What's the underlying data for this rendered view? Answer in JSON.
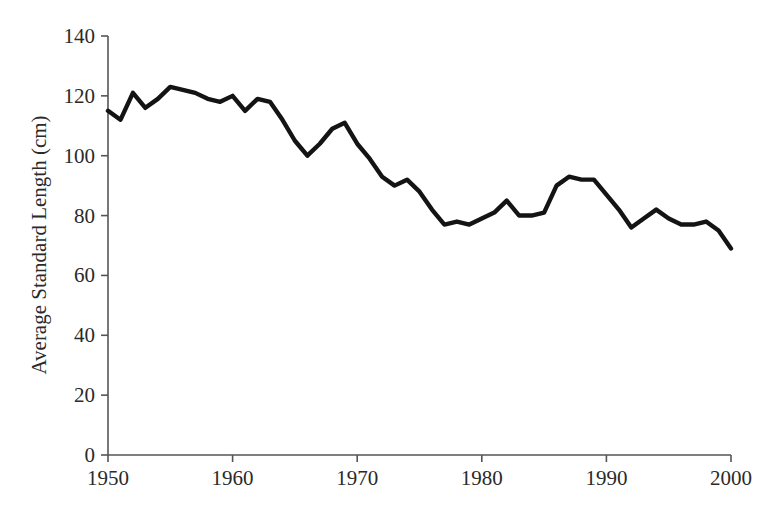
{
  "chart_data": {
    "type": "line",
    "title": "",
    "subtitle": "",
    "xlabel": "",
    "ylabel": "Average Standard Length (cm)",
    "xlim": [
      1950,
      2000
    ],
    "ylim": [
      0,
      140
    ],
    "grid": false,
    "legend": null,
    "legend_position": "none",
    "x_ticks": [
      1950,
      1960,
      1970,
      1980,
      1990,
      2000
    ],
    "x_tick_labels": [
      "1950",
      "1960",
      "1970",
      "1980",
      "1990",
      "2000"
    ],
    "y_ticks": [
      0,
      20,
      40,
      60,
      80,
      100,
      120,
      140
    ],
    "y_tick_labels": [
      "0",
      "20",
      "40",
      "60",
      "80",
      "100",
      "120",
      "140"
    ],
    "line_color": "#141414",
    "background_color": "#ffffff",
    "axis_color": "#555555",
    "x": [
      1950,
      1951,
      1952,
      1953,
      1954,
      1955,
      1956,
      1957,
      1958,
      1959,
      1960,
      1961,
      1962,
      1963,
      1964,
      1965,
      1966,
      1967,
      1968,
      1969,
      1970,
      1971,
      1972,
      1973,
      1974,
      1975,
      1976,
      1977,
      1978,
      1979,
      1980,
      1981,
      1982,
      1983,
      1984,
      1985,
      1986,
      1987,
      1988,
      1989,
      1990,
      1991,
      1992,
      1993,
      1994,
      1995,
      1996,
      1997,
      1998,
      1999,
      2000
    ],
    "values": [
      115,
      112,
      121,
      116,
      119,
      123,
      122,
      121,
      119,
      118,
      120,
      115,
      119,
      118,
      112,
      105,
      100,
      104,
      109,
      111,
      104,
      99,
      93,
      90,
      92,
      88,
      82,
      77,
      78,
      77,
      79,
      81,
      85,
      80,
      80,
      81,
      90,
      93,
      92,
      92,
      87,
      82,
      76,
      79,
      82,
      79,
      77,
      77,
      78,
      75,
      69
    ],
    "series": [
      {
        "name": "Average Standard Length",
        "values": [
          115,
          112,
          121,
          116,
          119,
          123,
          122,
          121,
          119,
          118,
          120,
          115,
          119,
          118,
          112,
          105,
          100,
          104,
          109,
          111,
          104,
          99,
          93,
          90,
          92,
          88,
          82,
          77,
          78,
          77,
          79,
          81,
          85,
          80,
          80,
          81,
          90,
          93,
          92,
          92,
          87,
          82,
          76,
          79,
          82,
          79,
          77,
          77,
          78,
          75,
          69
        ]
      }
    ],
    "annotations": []
  }
}
